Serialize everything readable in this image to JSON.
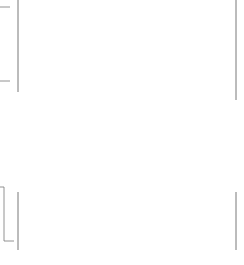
{
  "drawing": {
    "title": "Plate with 8 holes - dimensioned drawing",
    "colors": {
      "outline": "#1a1a1a",
      "dimension": "#555555",
      "centerline": "#444444",
      "text": "#3a3a3a",
      "background": "#ffffff"
    },
    "top_dimensions": [
      {
        "label": "66",
        "y": 7,
        "x_end": 236
      },
      {
        "label": "54",
        "y": 25,
        "x_end": 195
      },
      {
        "label": "40",
        "y": 43,
        "x_end": 149
      },
      {
        "label": "26",
        "y": 62,
        "x_end": 103
      },
      {
        "label": "12",
        "y": 81,
        "x_end": 57
      }
    ],
    "bottom_dimensions": [
      {
        "label": "12",
        "x_start": 18,
        "x_end": 57
      },
      {
        "label": "14",
        "x_start": 57,
        "x_end": 103
      },
      {
        "label": "14",
        "x_start": 103,
        "x_end": 149
      },
      {
        "label": "14",
        "x_start": 149,
        "x_end": 195
      },
      {
        "label": "12",
        "x_start": 195,
        "x_end": 236
      }
    ],
    "holes": {
      "count": 8,
      "columns_x": [
        57,
        103,
        149,
        195
      ],
      "rows_y": [
        131,
        176
      ],
      "radius": 13
    },
    "plate": {
      "x": 18,
      "y": 103,
      "width": 218,
      "height": 105,
      "corner_radius": 18
    }
  }
}
